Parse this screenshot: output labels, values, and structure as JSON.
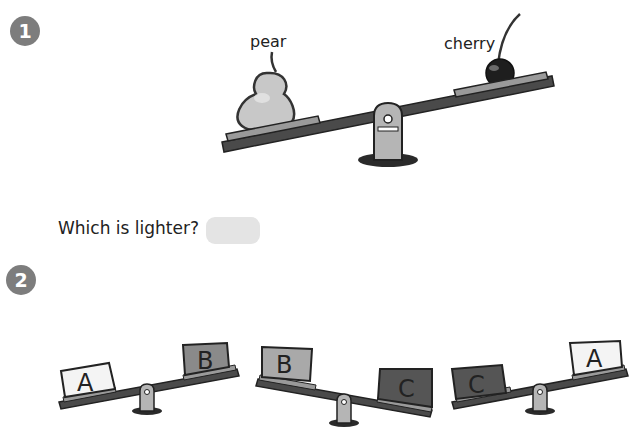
{
  "questions": [
    {
      "number": "1",
      "seesaw": {
        "left_item": "pear",
        "right_item": "cherry",
        "heavier_side": "left"
      },
      "prompt": "Which is lighter?",
      "answer": ""
    },
    {
      "number": "2",
      "seesaws": [
        {
          "left": "A",
          "right": "B",
          "heavier_side": "left",
          "left_color": "#f4f4f4",
          "right_color": "#8a8a8a"
        },
        {
          "left": "B",
          "right": "C",
          "heavier_side": "right",
          "left_color": "#a9a9a9",
          "right_color": "#555555"
        },
        {
          "left": "C",
          "right": "A",
          "heavier_side": "left",
          "left_color": "#555555",
          "right_color": "#f4f4f4"
        }
      ]
    }
  ],
  "colors": {
    "badge": "#7d7d7d",
    "beam": "#4a4a4a",
    "platform": "#9a9a9a",
    "pivot": "#b5b5b5",
    "answer_box": "#e4e4e4"
  }
}
